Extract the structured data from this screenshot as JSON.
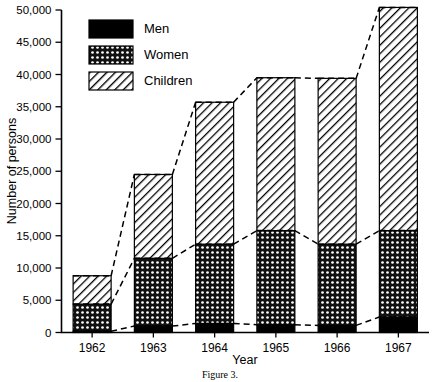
{
  "chart_data": {
    "type": "bar",
    "subtype": "stacked-bar-with-trend-lines",
    "title": "",
    "xlabel": "Year",
    "ylabel": "Number of persons",
    "categories": [
      "1962",
      "1963",
      "1964",
      "1965",
      "1966",
      "1967"
    ],
    "series": [
      {
        "name": "Men",
        "values": [
          200,
          1000,
          1400,
          1200,
          1100,
          2400
        ],
        "pattern": "solid-black",
        "color": "#000000"
      },
      {
        "name": "Women",
        "values": [
          4200,
          10500,
          12300,
          14600,
          12600,
          13400
        ],
        "pattern": "dotted-checker",
        "color": "#333333"
      },
      {
        "name": "Children",
        "values": [
          4400,
          13000,
          22000,
          23700,
          25700,
          34600
        ],
        "pattern": "diagonal-hatch",
        "color": "#888888"
      }
    ],
    "totals": [
      8800,
      24500,
      35700,
      39500,
      39400,
      50400
    ],
    "cumulative_men": [
      200,
      1000,
      1400,
      1200,
      1100,
      2400
    ],
    "cumulative_men_women": [
      4400,
      11500,
      13700,
      15800,
      13700,
      15800
    ],
    "ylim": [
      0,
      50000
    ],
    "ytick_values": [
      0,
      5000,
      10000,
      15000,
      20000,
      25000,
      30000,
      35000,
      40000,
      45000,
      50000
    ],
    "ytick_labels": [
      "0",
      "5,000",
      "10,000",
      "15,000",
      "20,000",
      "25,000",
      "30,000",
      "35,000",
      "40,000",
      "45,000",
      "50,000"
    ],
    "grid": false,
    "legend_position": "top-left-inside",
    "legend_entries": [
      "Men",
      "Women",
      "Children"
    ],
    "trend_lines": [
      {
        "name": "men-trend",
        "points": [
          200,
          1000,
          1400,
          1200,
          1100,
          2400
        ]
      },
      {
        "name": "women-cumulative-trend",
        "points": [
          4400,
          11500,
          13700,
          15800,
          13700,
          15800
        ]
      },
      {
        "name": "total-trend",
        "points": [
          8800,
          24500,
          35700,
          39500,
          39400,
          50400
        ]
      }
    ]
  },
  "caption": "Figure 3.",
  "legend": {
    "items": [
      {
        "label": "Men"
      },
      {
        "label": "Women"
      },
      {
        "label": "Children"
      }
    ]
  },
  "axes": {
    "y_title": "Number of persons",
    "x_title": "Year"
  }
}
